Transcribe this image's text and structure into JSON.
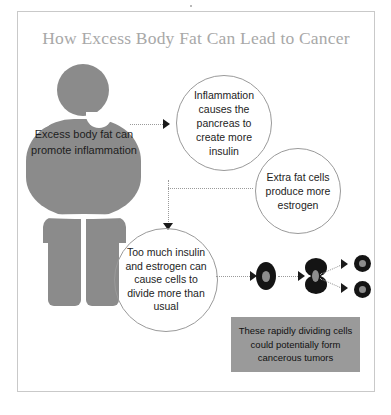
{
  "infographic": {
    "title": "How Excess Body Fat Can Lead to Cancer",
    "figure": {
      "name": "overweight-person-silhouette",
      "label": "Excess body fat can promote inflammation",
      "color": "#8b8b8b"
    },
    "steps": [
      {
        "id": "inflammation",
        "shape": "circle",
        "label": "Inflammation causes the pancreas to create more insulin"
      },
      {
        "id": "estrogen",
        "shape": "circle",
        "label": "Extra fat cells produce more estrogen"
      },
      {
        "id": "cell-division",
        "shape": "circle",
        "label": "Too much insulin and estrogen can cause cells to divide more than usual"
      }
    ],
    "cells": {
      "single_label": "single-cell",
      "dividing_label": "dividing-cell",
      "daughter_label": "daughter-cell",
      "fill": "#141414",
      "nucleus_fill": "#8d8d8d"
    },
    "callout": {
      "label": "These rapidly dividing cells could potentially form cancerous tumors",
      "background": "#9a9a9a"
    },
    "styles": {
      "title_color": "#a8a8a8",
      "frame_color": "#c9c9c9",
      "connector_color": "#9a9a9a",
      "arrowhead_color": "#1a1a1a",
      "text_color": "#1d1d1d"
    }
  }
}
